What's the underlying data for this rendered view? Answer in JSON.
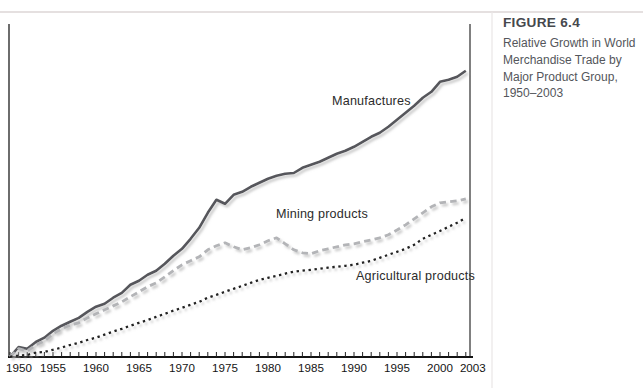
{
  "figure": {
    "label": "FIGURE 6.4",
    "caption": "Relative Growth in World\nMerchandise Trade by\nMajor Product Group,\n1950–2003"
  },
  "chart_data": {
    "type": "line",
    "title": "Relative Growth in World Merchandise Trade by Major Product Group, 1950–2003",
    "xlabel": "",
    "ylabel": "",
    "legend_position": "inline-labels-on-lines",
    "grid": false,
    "x_axis": {
      "min": 1950,
      "max": 2003,
      "tick_step": 1,
      "labeled_ticks": [
        1950,
        1955,
        1960,
        1965,
        1970,
        1975,
        1980,
        1985,
        1990,
        1995,
        2000,
        2003
      ]
    },
    "y_axis": {
      "scale": "log",
      "labels_shown": false,
      "implied_index": "1950 = 100",
      "range": [
        100,
        10000
      ]
    },
    "years": [
      1950,
      1951,
      1952,
      1953,
      1954,
      1955,
      1956,
      1957,
      1958,
      1959,
      1960,
      1961,
      1962,
      1963,
      1964,
      1965,
      1966,
      1967,
      1968,
      1969,
      1970,
      1971,
      1972,
      1973,
      1974,
      1975,
      1976,
      1977,
      1978,
      1979,
      1980,
      1981,
      1982,
      1983,
      1984,
      1985,
      1986,
      1987,
      1988,
      1989,
      1990,
      1991,
      1992,
      1993,
      1994,
      1995,
      1996,
      1997,
      1998,
      1999,
      2000,
      2001,
      2002,
      2003
    ],
    "series": [
      {
        "name": "Manufactures",
        "style": "solid",
        "color": "#56575b",
        "values": [
          100,
          117,
          114,
          127,
          136,
          152,
          165,
          176,
          187,
          206,
          224,
          235,
          259,
          280,
          319,
          340,
          375,
          400,
          447,
          509,
          569,
          669,
          798,
          1016,
          1253,
          1175,
          1358,
          1425,
          1545,
          1647,
          1757,
          1844,
          1904,
          1930,
          2097,
          2201,
          2310,
          2464,
          2628,
          2758,
          2942,
          3189,
          3455,
          3686,
          4060,
          4543,
          5086,
          5690,
          6475,
          7130,
          8375,
          8650,
          9080,
          10000
        ]
      },
      {
        "name": "Mining products",
        "style": "dashed",
        "color": "#b3b4b7",
        "values": [
          100,
          114,
          110,
          121,
          129,
          145,
          157,
          167,
          173,
          187,
          200,
          213,
          227,
          242,
          263,
          285,
          309,
          329,
          362,
          400,
          440,
          469,
          500,
          560,
          597,
          627,
          588,
          560,
          578,
          607,
          647,
          680,
          617,
          560,
          534,
          525,
          551,
          569,
          588,
          607,
          617,
          637,
          657,
          680,
          713,
          771,
          837,
          921,
          1016,
          1120,
          1194,
          1213,
          1232,
          1272
        ]
      },
      {
        "name": "Agricultural products",
        "style": "dotted",
        "color": "#202020",
        "values": [
          100,
          102,
          103,
          107,
          108,
          112,
          116,
          121,
          125,
          131,
          136,
          143,
          150,
          157,
          165,
          173,
          181,
          190,
          200,
          210,
          220,
          231,
          242,
          259,
          271,
          285,
          299,
          313,
          329,
          345,
          357,
          368,
          381,
          394,
          400,
          406,
          413,
          420,
          426,
          433,
          440,
          455,
          469,
          492,
          517,
          542,
          569,
          607,
          669,
          713,
          758,
          811,
          865,
          938
        ]
      }
    ]
  }
}
